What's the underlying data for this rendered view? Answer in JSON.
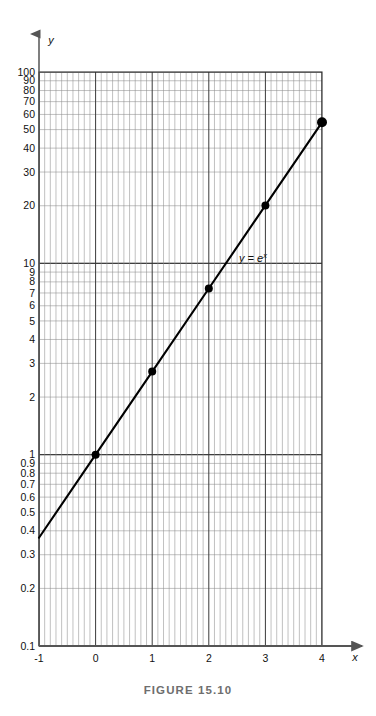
{
  "figure": {
    "caption": "FIGURE 15.10",
    "x_axis_name": "x",
    "y_axis_name": "y",
    "curve_label_base": "y = e",
    "curve_label_exponent": "x"
  },
  "colors": {
    "ink": "#111111",
    "caption": "#6e6e6e",
    "grid_major": "#3a3a3a",
    "grid_minor": "#8d8d8d",
    "axis": "#555555",
    "curve": "#000000"
  },
  "chart_data": {
    "type": "line",
    "title": "FIGURE 15.10",
    "subtitle": "",
    "xlabel": "x",
    "ylabel": "y",
    "yscale": "log",
    "xscale": "linear",
    "xlim": [
      -1,
      4
    ],
    "ylim": [
      0.1,
      100
    ],
    "grid": true,
    "grid_style": "semi-log graph paper, 10 minor divisions per x unit",
    "legend": "none",
    "annotations": [
      {
        "text": "y = e^x",
        "x": 2.55,
        "y": 12.5
      }
    ],
    "xticks": [
      -1,
      0,
      1,
      2,
      3,
      4
    ],
    "xticklabels": [
      "-1",
      "0",
      "1",
      "2",
      "3",
      "4"
    ],
    "yticks": [
      0.1,
      0.2,
      0.3,
      0.4,
      0.5,
      0.6,
      0.7,
      0.8,
      0.9,
      1,
      2,
      3,
      4,
      5,
      6,
      7,
      8,
      9,
      10,
      20,
      30,
      40,
      50,
      60,
      70,
      80,
      90,
      100
    ],
    "yticklabels": [
      "0.1",
      "0.2",
      "0.3",
      "0.4",
      "0.5",
      "0.6",
      "0.7",
      "0.8",
      "0.9",
      "1",
      "2",
      "3",
      "4",
      "5",
      "6",
      "7",
      "8",
      "9",
      "10",
      "20",
      "30",
      "40",
      "50",
      "60",
      "70",
      "80",
      "90",
      "100"
    ],
    "series": [
      {
        "name": "y = e^x",
        "equation": "y = e^x",
        "line": true,
        "x": [
          -1,
          0,
          1,
          2,
          3,
          4
        ],
        "values": [
          0.368,
          1.0,
          2.718,
          7.389,
          20.086,
          54.598
        ],
        "markers_at": [
          0,
          1,
          2,
          3,
          4
        ],
        "marker_values": [
          1.0,
          2.718,
          7.389,
          20.086,
          54.598
        ]
      }
    ]
  }
}
